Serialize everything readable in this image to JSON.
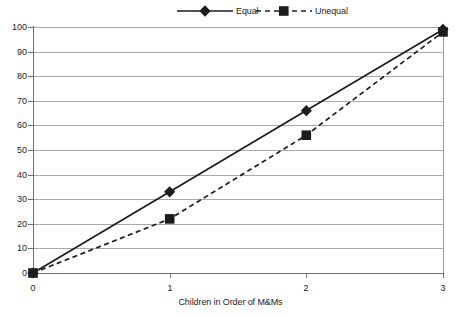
{
  "chart_data": {
    "type": "line",
    "title": "",
    "xlabel": "Children in Order of M&Ms",
    "ylabel": "",
    "x": [
      0,
      1,
      2,
      3
    ],
    "xticklabels": [
      "0",
      "1",
      "2",
      "3"
    ],
    "xlim": [
      0,
      3
    ],
    "ylim": [
      0,
      100
    ],
    "yticks": [
      0,
      10,
      20,
      30,
      40,
      50,
      60,
      70,
      80,
      90,
      100
    ],
    "yticklabels": [
      "0",
      "10",
      "20",
      "30",
      "40",
      "50",
      "60",
      "70",
      "80",
      "90",
      "100"
    ],
    "grid": "horizontal",
    "legend_position": "top-center",
    "series": [
      {
        "name": "Equal",
        "values": [
          0,
          33,
          66,
          99
        ],
        "line_style": "solid",
        "marker": "diamond",
        "color": "#1c1c1c"
      },
      {
        "name": "Unequal",
        "values": [
          0,
          22,
          56,
          98
        ],
        "line_style": "dashed",
        "marker": "square",
        "color": "#1c1c1c"
      }
    ]
  },
  "legend": {
    "entries": [
      {
        "label": "Equal",
        "marker": "diamond-marker-icon",
        "style": "solid"
      },
      {
        "label": "Unequal",
        "marker": "square-marker-icon",
        "style": "dashed"
      }
    ]
  },
  "colors": {
    "line": "#1c1c1c",
    "grid": "#a9a9a9",
    "axis": "#6f6f6f",
    "background": "#ffffff",
    "text": "#1c1c1c"
  }
}
